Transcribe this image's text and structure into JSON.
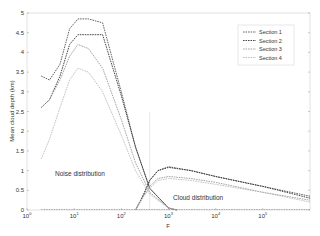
{
  "chart_data": {
    "type": "line",
    "title": "",
    "xlabel": "F",
    "ylabel": "Mean cloud depth (km)",
    "xscale": "log",
    "xlim": [
      1,
      1000000
    ],
    "ylim": [
      0,
      5
    ],
    "x_ticks": [
      "10^0",
      "10^1",
      "10^2",
      "10^3",
      "10^4",
      "10^5"
    ],
    "y_ticks": [
      "0",
      "0.5",
      "1",
      "1.5",
      "2",
      "2.5",
      "3",
      "3.5",
      "4",
      "4.5",
      "5"
    ],
    "grid": false,
    "legend_position": "upper right",
    "annotations": [
      {
        "text": "Noise distribution",
        "x": 12,
        "y": 1.3
      },
      {
        "text": "Cloud distribution",
        "x": 6000,
        "y": 0.6
      }
    ],
    "vertical_marker_x": 400,
    "series": [
      {
        "name": "Section 1",
        "color": "#555555",
        "noise_curve": {
          "x": [
            2,
            3,
            5,
            8,
            12,
            20,
            40,
            100,
            200,
            400,
            1000,
            1500
          ],
          "y": [
            3.4,
            3.3,
            3.7,
            4.6,
            4.85,
            4.85,
            4.75,
            3.0,
            1.6,
            0.55,
            0.05,
            0
          ]
        },
        "cloud_curve": {
          "x": [
            200,
            300,
            400,
            600,
            1000,
            3000,
            10000,
            100000,
            1000000
          ],
          "y": [
            0,
            0.4,
            0.75,
            1.0,
            1.1,
            1.0,
            0.85,
            0.6,
            0.35
          ]
        }
      },
      {
        "name": "Section 2",
        "color": "#333333",
        "noise_curve": {
          "x": [
            2,
            3,
            5,
            8,
            12,
            20,
            40,
            100,
            200,
            400,
            1000,
            1500
          ],
          "y": [
            2.6,
            2.8,
            3.4,
            4.2,
            4.45,
            4.45,
            4.45,
            2.9,
            1.6,
            0.55,
            0.05,
            0
          ]
        },
        "cloud_curve": {
          "x": [
            200,
            300,
            400,
            600,
            1000,
            3000,
            10000,
            100000,
            1000000
          ],
          "y": [
            0,
            0.4,
            0.75,
            1.0,
            1.08,
            1.0,
            0.85,
            0.6,
            0.3
          ]
        }
      },
      {
        "name": "Section 3",
        "color": "#999999",
        "noise_curve": {
          "x": [
            2,
            3,
            5,
            8,
            12,
            20,
            40,
            100,
            200,
            400,
            1000,
            1500
          ],
          "y": [
            2.6,
            2.8,
            3.3,
            3.9,
            4.2,
            4.1,
            3.6,
            2.3,
            1.2,
            0.45,
            0.05,
            0
          ]
        },
        "cloud_curve": {
          "x": [
            200,
            300,
            400,
            600,
            1000,
            3000,
            10000,
            100000,
            1000000
          ],
          "y": [
            0,
            0.35,
            0.6,
            0.8,
            0.85,
            0.8,
            0.7,
            0.45,
            0.25
          ]
        }
      },
      {
        "name": "Section 4",
        "color": "#bbbbbb",
        "noise_curve": {
          "x": [
            2,
            3,
            5,
            8,
            12,
            20,
            40,
            100,
            200,
            400,
            1000,
            1500
          ],
          "y": [
            1.3,
            1.8,
            2.6,
            3.3,
            3.6,
            3.5,
            3.0,
            1.9,
            1.0,
            0.4,
            0.05,
            0
          ]
        },
        "cloud_curve": {
          "x": [
            200,
            300,
            400,
            600,
            1000,
            3000,
            10000,
            100000,
            1000000
          ],
          "y": [
            0,
            0.35,
            0.55,
            0.75,
            0.8,
            0.75,
            0.65,
            0.45,
            0.2
          ]
        }
      }
    ]
  }
}
